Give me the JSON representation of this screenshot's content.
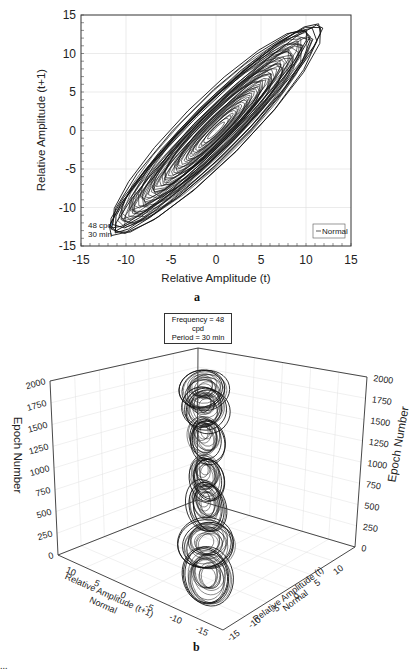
{
  "figure": {
    "panel_a_label": "a",
    "panel_b_label": "b",
    "caption_fragment": "..."
  },
  "chart_data": [
    {
      "type": "line",
      "id": "panel-a",
      "title": "",
      "xlabel": "Relative Amplitude (t)",
      "ylabel": "Relative Amplitude (t+1)",
      "xlim": [
        -15,
        15
      ],
      "ylim": [
        -15,
        15
      ],
      "xticks": [
        "-15",
        "-10",
        "-5",
        "0",
        "5",
        "10",
        "15"
      ],
      "yticks": [
        "15",
        "10",
        "5",
        "0",
        "-5",
        "-10",
        "-15"
      ],
      "grid": true,
      "legend": {
        "position": "lower right",
        "entries": [
          "Normal"
        ]
      },
      "annotation": {
        "line1": "48 cpd",
        "line2": "30 min"
      },
      "series": [
        {
          "name": "Normal",
          "description": "Phase portrait: nested elliptical loops along the diagonal y=x, outer extent roughly (-11.5,-11.5) to (11.5,11.5)",
          "outer_extent": {
            "xmin": -11.8,
            "xmax": 11.8,
            "ymin": -11.5,
            "ymax": 11.5
          },
          "major_axis_angle_deg": 45
        }
      ]
    },
    {
      "type": "line",
      "id": "panel-b",
      "subtype": "3d",
      "title_box": {
        "line1": "Frequency = 48 cpd",
        "line2": "Period = 30 min"
      },
      "zlabel": "Epoch Number",
      "zticks": [
        "0",
        "250",
        "500",
        "750",
        "1000",
        "1250",
        "1500",
        "1750",
        "2000"
      ],
      "zlim": [
        0,
        2000
      ],
      "xlabel": "Relative Amplitude (t+1)",
      "xlabel_sub": "Normal",
      "xticks": [
        "10",
        "5",
        "0",
        "-5",
        "-10",
        "-15"
      ],
      "ylabel": "Relative Amplitude (t)",
      "ylabel_sub": "Normal",
      "yticks": [
        "-15",
        "-10",
        "-5",
        "0",
        "5",
        "10"
      ],
      "grid": true,
      "series": [
        {
          "name": "Normal",
          "description": "Stacked elliptical loops forming a vertical column along epochs 0–2000, with several distinct loop clusters"
        }
      ]
    }
  ]
}
